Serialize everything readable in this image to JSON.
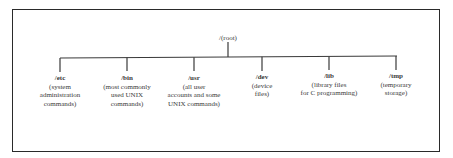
{
  "diagram": {
    "root": {
      "label": "/(root)"
    },
    "children": [
      {
        "name": "/etc",
        "description": [
          "(system",
          "administration",
          "commands)"
        ]
      },
      {
        "name": "/bin",
        "description": [
          "(most commonly",
          "used UNIX",
          "commands)"
        ]
      },
      {
        "name": "/usr",
        "description": [
          "(all user",
          "accounts and some",
          "UNIX commands)"
        ]
      },
      {
        "name": "/dev",
        "description": [
          "(device",
          "files)"
        ]
      },
      {
        "name": "/lib",
        "description": [
          "(library files",
          "for C programming)"
        ]
      },
      {
        "name": "/tmp",
        "description": [
          "(temporary",
          "storage)"
        ]
      }
    ],
    "colors": {
      "line": "#3a3a3a",
      "text": "#3a3a3a",
      "border": "#2a2a2a"
    }
  }
}
